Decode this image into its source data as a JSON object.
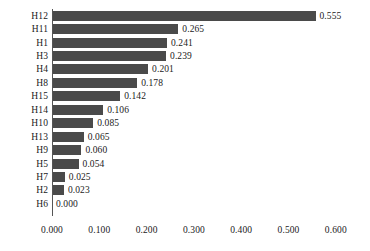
{
  "chart_data": {
    "type": "bar",
    "orientation": "horizontal",
    "title": "",
    "xlabel": "",
    "ylabel": "",
    "categories": [
      "H12",
      "H11",
      "H1",
      "H3",
      "H4",
      "H8",
      "H15",
      "H14",
      "H10",
      "H13",
      "H9",
      "H5",
      "H7",
      "H2",
      "H6"
    ],
    "values": [
      0.555,
      0.265,
      0.241,
      0.239,
      0.201,
      0.178,
      0.142,
      0.106,
      0.085,
      0.065,
      0.06,
      0.054,
      0.025,
      0.023,
      0.0
    ],
    "value_labels": [
      "0.555",
      "0.265",
      "0.241",
      "0.239",
      "0.201",
      "0.178",
      "0.142",
      "0.106",
      "0.085",
      "0.065",
      "0.060",
      "0.054",
      "0.025",
      "0.023",
      "0.000"
    ],
    "xlim": [
      0.0,
      0.6
    ],
    "xticks": [
      0.0,
      0.1,
      0.2,
      0.3,
      0.4,
      0.5,
      0.6
    ],
    "xtick_labels": [
      "0.000",
      "0.100",
      "0.200",
      "0.300",
      "0.400",
      "0.500",
      "0.600"
    ],
    "grid": false,
    "legend": null,
    "bar_color": "#4a4a4a",
    "background_color": "#ffffff",
    "axis_color": "#555555",
    "sorted": "descending"
  },
  "layout": {
    "axis_origin_x_px": 52,
    "px_per_unit": 473,
    "plot_top_px": 9,
    "row_pitch_px": 13.45,
    "bar_height_px": 10
  }
}
